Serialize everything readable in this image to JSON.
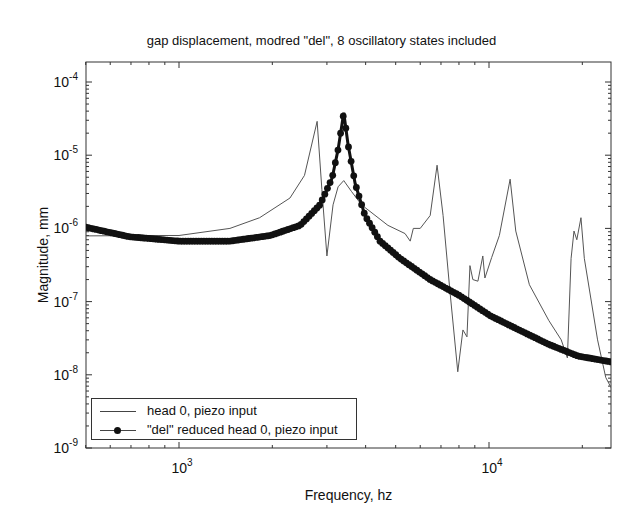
{
  "chart_data": {
    "type": "line",
    "title": "gap displacement, modred \"del\", 8 oscillatory states included",
    "xlabel": "Frequency, hz",
    "ylabel": "Magnitude, mm",
    "xscale": "log",
    "yscale": "log",
    "xlim": [
      500,
      25000
    ],
    "ylim": [
      1e-09,
      0.00019
    ],
    "xticks": [
      {
        "value": 1000,
        "label_base": "10",
        "label_exp": "3"
      },
      {
        "value": 10000,
        "label_base": "10",
        "label_exp": "4"
      }
    ],
    "yticks": [
      {
        "value": 0.0001,
        "label_base": "10",
        "label_exp": "-4"
      },
      {
        "value": 1e-05,
        "label_base": "10",
        "label_exp": "-5"
      },
      {
        "value": 1e-06,
        "label_base": "10",
        "label_exp": "-6"
      },
      {
        "value": 1e-07,
        "label_base": "10",
        "label_exp": "-7"
      },
      {
        "value": 1e-08,
        "label_base": "10",
        "label_exp": "-8"
      },
      {
        "value": 1e-09,
        "label_base": "10",
        "label_exp": "-9"
      }
    ],
    "grid": false,
    "legend_position": "lower left",
    "series": [
      {
        "name": "head 0, piezo input",
        "style": "thin-line",
        "color": "#555555",
        "x": [
          500,
          800,
          1000,
          1460,
          1820,
          2280,
          2540,
          2790,
          2890,
          3000,
          3140,
          3260,
          3400,
          3600,
          3880,
          4720,
          5360,
          5570,
          5700,
          6000,
          6460,
          6800,
          7110,
          7480,
          7930,
          8240,
          8490,
          8680,
          8870,
          9210,
          9550,
          9700,
          10200,
          10800,
          11700,
          12200,
          13500,
          15600,
          17100,
          17900,
          18400,
          18800,
          19200,
          19800,
          20300,
          22400,
          23800,
          24800
        ],
        "y": [
          7.9e-07,
          8e-07,
          8e-07,
          1e-06,
          1.4e-06,
          2.6e-06,
          5.3e-06,
          2.9e-05,
          3.4e-06,
          4.2e-07,
          2.1e-06,
          3.7e-06,
          4.5e-06,
          3.2e-06,
          2.1e-06,
          1.1e-06,
          8.5e-07,
          6.7e-07,
          1e-06,
          1e-06,
          1.5e-06,
          7.3e-06,
          1.5e-06,
          1.4e-07,
          1.1e-08,
          4.1e-08,
          3.3e-08,
          3.1e-07,
          2e-07,
          1.9e-07,
          4.2e-07,
          2.1e-07,
          4e-07,
          8e-07,
          4.7e-06,
          9.2e-07,
          1.7e-07,
          5.5e-08,
          3e-08,
          1.7e-08,
          3.9e-07,
          9.2e-07,
          7e-07,
          1.4e-06,
          3.9e-07,
          3e-08,
          9.2e-09,
          6.6e-09
        ]
      },
      {
        "name": "\"del\" reduced head 0, piezo input",
        "style": "line-with-dot-markers",
        "color": "#111111",
        "x": [
          500,
          690,
          1000,
          1460,
          1970,
          2460,
          2850,
          3120,
          3260,
          3400,
          3510,
          3700,
          3980,
          4450,
          5160,
          6460,
          8060,
          10100,
          12500,
          15600,
          19400,
          24800
        ],
        "y": [
          1.04e-06,
          7.7e-07,
          6.7e-07,
          6.7e-07,
          8e-07,
          1.1e-06,
          2.1e-06,
          4.9e-06,
          1.2e-05,
          3.8e-05,
          1.4e-05,
          4.1e-06,
          1.5e-06,
          6.7e-07,
          3.9e-07,
          2e-07,
          1.2e-07,
          6.4e-08,
          4.1e-08,
          2.6e-08,
          1.8e-08,
          1.5e-08
        ]
      }
    ]
  },
  "legend": {
    "items": [
      {
        "label": "head 0, piezo input"
      },
      {
        "label": "\"del\" reduced head 0, piezo input"
      }
    ]
  }
}
